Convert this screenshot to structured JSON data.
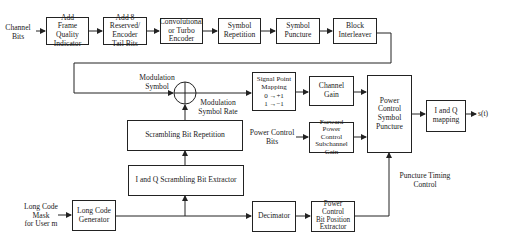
{
  "diagram": {
    "type": "block-diagram",
    "blocks": [
      {
        "id": "frame_quality",
        "label": "Add\nFrame\nQuality\nIndicator"
      },
      {
        "id": "tail_bits",
        "label": "Add 8\nReserved/\nEncoder\nTail Bits"
      },
      {
        "id": "encoder",
        "label": "Convolutional\nor Turbo\nEncoder"
      },
      {
        "id": "symbol_repetition",
        "label": "Symbol\nRepetition"
      },
      {
        "id": "symbol_puncture",
        "label": "Symbol\nPuncture"
      },
      {
        "id": "block_interleaver",
        "label": "Block\nInterleaver"
      },
      {
        "id": "signal_point_mapping",
        "label": "Signal Point\nMapping\n0 →+1\n1 →−1"
      },
      {
        "id": "channel_gain",
        "label": "Channel\nGain"
      },
      {
        "id": "pc_symbol_puncture",
        "label": "Power\nControl\nSymbol\nPuncture"
      },
      {
        "id": "iq_mapping",
        "label": "I and Q\nmapping"
      },
      {
        "id": "fwd_pc_subchannel_gain",
        "label": "Forward Power\nControl\nSubchannel\nGain"
      },
      {
        "id": "scrambling_bit_repetition",
        "label": "Scrambling Bit Repetition"
      },
      {
        "id": "iq_scrambling_extractor",
        "label": "I and Q Scrambling Bit Extractor"
      },
      {
        "id": "long_code_generator",
        "label": "Long Code\nGenerator"
      },
      {
        "id": "decimator",
        "label": "Decimator"
      },
      {
        "id": "pc_bit_position_extractor",
        "label": "Power\nControl\nBit Position\nExtractor"
      }
    ],
    "labels": {
      "channel_bits": "Channel\nBits",
      "modulation_symbol": "Modulation\nSymbol",
      "modulation_symbol_rate": "Modulation\nSymbol Rate",
      "power_control_bits": "Power Control\nBits",
      "puncture_timing_control": "Puncture Timing\nControl",
      "long_code_mask": "Long Code\nMask\nfor User m",
      "output": "s(t)"
    },
    "adder_symbol": "+",
    "colors": {
      "line": "#222222",
      "background": "#ffffff"
    }
  }
}
